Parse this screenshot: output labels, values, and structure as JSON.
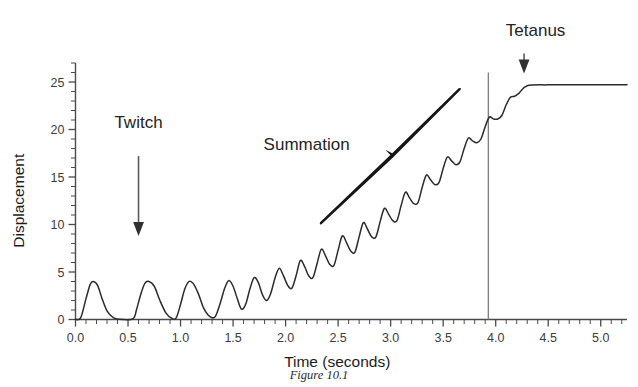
{
  "figure": {
    "caption": "Figure 10.1"
  },
  "chart_data": {
    "type": "line",
    "title": "",
    "xlabel": "Time (seconds)",
    "ylabel": "Displacement",
    "xlim": [
      0.0,
      5.25
    ],
    "ylim": [
      0,
      27
    ],
    "grid": false,
    "legend": "none",
    "x_major_ticks": [
      "0.0",
      "0.5",
      "1.0",
      "1.5",
      "2.0",
      "2.5",
      "3.0",
      "3.5",
      "4.0",
      "4.5",
      "5.0"
    ],
    "x_major_values": [
      0.0,
      0.5,
      1.0,
      1.5,
      2.0,
      2.5,
      3.0,
      3.5,
      4.0,
      4.5,
      5.0
    ],
    "x_minor_step": 0.1,
    "y_major_ticks": [
      "0",
      "5",
      "10",
      "15",
      "20",
      "25"
    ],
    "y_major_values": [
      0,
      5,
      10,
      15,
      20,
      25
    ],
    "y_minor_step": 1,
    "series": [
      {
        "name": "Muscle displacement",
        "color": "#2b2b2b",
        "description": "Single twitches at low stimulus frequency, then wave summation with rising baseline, then fused tetanus plateau",
        "x": [
          0.0,
          0.05,
          0.1,
          0.14,
          0.17,
          0.21,
          0.25,
          0.3,
          0.36,
          0.45,
          0.55,
          0.58,
          0.62,
          0.66,
          0.7,
          0.75,
          0.8,
          0.86,
          0.92,
          0.96,
          1.0,
          1.04,
          1.08,
          1.12,
          1.17,
          1.22,
          1.28,
          1.33,
          1.38,
          1.42,
          1.46,
          1.5,
          1.54,
          1.58,
          1.62,
          1.66,
          1.7,
          1.74,
          1.78,
          1.82,
          1.86,
          1.9,
          1.94,
          1.98,
          2.02,
          2.06,
          2.1,
          2.14,
          2.18,
          2.22,
          2.26,
          2.3,
          2.34,
          2.38,
          2.42,
          2.46,
          2.5,
          2.54,
          2.58,
          2.62,
          2.66,
          2.7,
          2.74,
          2.78,
          2.82,
          2.86,
          2.9,
          2.94,
          2.98,
          3.02,
          3.06,
          3.1,
          3.14,
          3.18,
          3.22,
          3.26,
          3.3,
          3.34,
          3.38,
          3.42,
          3.46,
          3.5,
          3.54,
          3.58,
          3.62,
          3.66,
          3.7,
          3.74,
          3.78,
          3.82,
          3.86,
          3.9,
          3.94,
          3.98,
          4.02,
          4.06,
          4.1,
          4.14,
          4.18,
          4.22,
          4.3,
          4.5,
          4.8,
          5.1,
          5.25
        ],
        "y": [
          0.0,
          0.2,
          2.2,
          3.7,
          4.0,
          3.6,
          2.3,
          0.9,
          0.2,
          0.0,
          0.1,
          1.0,
          2.6,
          3.8,
          4.0,
          3.5,
          2.1,
          0.7,
          0.1,
          0.2,
          1.6,
          3.2,
          4.0,
          3.8,
          2.7,
          1.2,
          0.3,
          0.3,
          1.8,
          3.3,
          4.1,
          3.5,
          2.2,
          1.1,
          1.6,
          3.2,
          4.4,
          3.9,
          2.6,
          2.0,
          2.8,
          4.4,
          5.4,
          4.6,
          3.6,
          3.3,
          4.6,
          6.2,
          5.6,
          4.6,
          4.4,
          5.9,
          7.4,
          6.7,
          5.8,
          5.7,
          7.3,
          8.8,
          8.1,
          7.2,
          7.1,
          8.7,
          10.2,
          9.5,
          8.7,
          8.7,
          10.3,
          11.7,
          11.1,
          10.4,
          10.4,
          12.0,
          13.4,
          12.8,
          12.2,
          12.3,
          13.9,
          15.2,
          14.7,
          14.2,
          14.4,
          15.9,
          17.1,
          16.7,
          16.3,
          16.6,
          18.0,
          19.1,
          18.8,
          18.6,
          19.0,
          20.3,
          21.3,
          21.1,
          21.1,
          21.5,
          22.6,
          23.4,
          23.5,
          23.8,
          24.6,
          24.7,
          24.7,
          24.7,
          24.7
        ]
      }
    ],
    "markers": [
      {
        "name": "stimulus-line",
        "type": "vline",
        "x": 3.93,
        "y_top": 26.0,
        "color": "#7d7d7d"
      }
    ],
    "annotations": [
      {
        "id": "twitch",
        "label": "Twitch",
        "text_x": 0.6,
        "text_y": 20.2,
        "arrow": {
          "from_x": 0.6,
          "from_y": 17.2,
          "to_x": 0.6,
          "to_y": 8.8
        }
      },
      {
        "id": "summation",
        "label": "Summation",
        "text_x": 2.2,
        "text_y": 17.8,
        "brace": {
          "x1": 2.34,
          "y1": 10.1,
          "x2": 3.66,
          "y2": 24.2,
          "notch_x": 3.0,
          "notch_y": 17.3
        }
      },
      {
        "id": "tetanus",
        "label": "Tetanus",
        "text_x": 4.38,
        "text_y": 29.8,
        "arrow": {
          "from_x": 4.27,
          "from_y": 28.0,
          "to_x": 4.27,
          "to_y": 25.9
        }
      }
    ]
  }
}
